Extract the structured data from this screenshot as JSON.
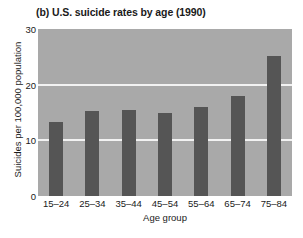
{
  "chart_data": {
    "type": "bar",
    "title": "(b) U.S. suicide rates by age (1990)",
    "xlabel": "Age group",
    "ylabel": "Suicides per 100,000 population",
    "categories": [
      "15–24",
      "25–34",
      "35–44",
      "45–54",
      "55–64",
      "65–74",
      "75–84"
    ],
    "values": [
      13.3,
      15.3,
      15.5,
      15.0,
      16.0,
      18.0,
      25.1
    ],
    "ylim": [
      0,
      30
    ],
    "yticks": [
      0,
      10,
      20,
      30
    ],
    "ytick_labels": [
      "0",
      "10",
      "20",
      "30"
    ],
    "gridlines": [
      10,
      20
    ],
    "grid": true,
    "legend": "none",
    "colors": {
      "bar": "#555555",
      "plot_background": "#a9a9a9",
      "gridline": "#f2f2f2",
      "figure_background": "#ffffff",
      "text": "#1a1a1a"
    }
  }
}
